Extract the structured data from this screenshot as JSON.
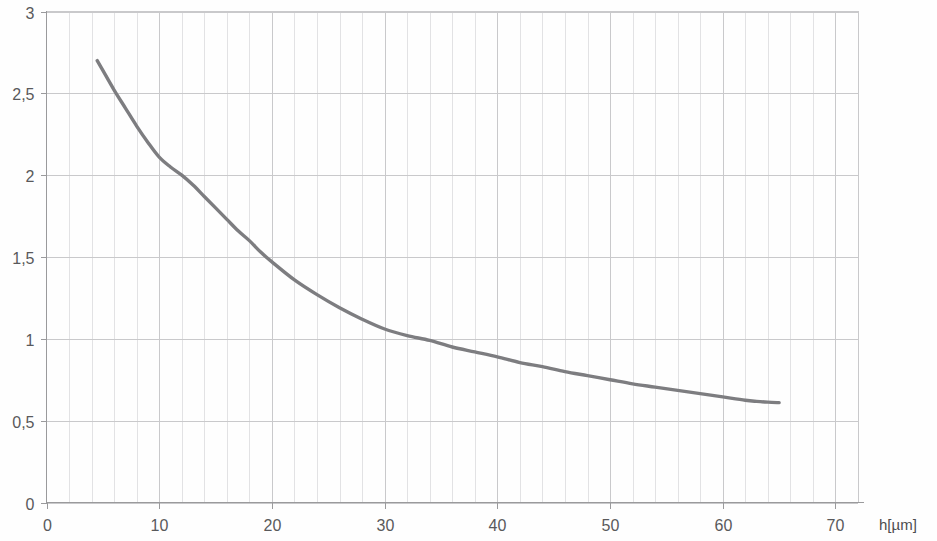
{
  "chart_data": {
    "type": "line",
    "title": "",
    "subtitle": "",
    "xlabel": "h[µm]",
    "ylabel": "",
    "xlim": [
      0,
      72
    ],
    "ylim": [
      0,
      3
    ],
    "grid": true,
    "legend": "none",
    "decimal_separator": ",",
    "x_ticks": [
      0,
      10,
      20,
      30,
      40,
      50,
      60,
      70
    ],
    "x_tick_labels": [
      "0",
      "10",
      "20",
      "30",
      "40",
      "50",
      "60",
      "70"
    ],
    "y_ticks": [
      0,
      0.5,
      1,
      1.5,
      2,
      2.5,
      3
    ],
    "y_tick_labels": [
      "0",
      "0,5",
      "1",
      "1,5",
      "2",
      "2,5",
      "3"
    ],
    "x_minor_step": 2,
    "series": [
      {
        "name": "curve",
        "color": "#7d7d80",
        "x": [
          4.5,
          5,
          6,
          7,
          8,
          9,
          10,
          11,
          12,
          13,
          14,
          15,
          16,
          17,
          18,
          19,
          20,
          22,
          24,
          26,
          28,
          30,
          32,
          34,
          36,
          38,
          40,
          42,
          44,
          46,
          48,
          50,
          52,
          54,
          56,
          58,
          60,
          62,
          63,
          64,
          65
        ],
        "y": [
          2.7,
          2.64,
          2.52,
          2.41,
          2.3,
          2.2,
          2.11,
          2.05,
          2.0,
          1.94,
          1.87,
          1.8,
          1.73,
          1.66,
          1.6,
          1.53,
          1.47,
          1.36,
          1.27,
          1.19,
          1.12,
          1.06,
          1.02,
          0.99,
          0.95,
          0.92,
          0.89,
          0.855,
          0.83,
          0.8,
          0.775,
          0.75,
          0.725,
          0.705,
          0.685,
          0.665,
          0.645,
          0.625,
          0.618,
          0.613,
          0.61
        ]
      }
    ]
  },
  "axis": {
    "x_title": "h[µm]",
    "x_labels": [
      "0",
      "10",
      "20",
      "30",
      "40",
      "50",
      "60",
      "70"
    ],
    "y_labels": [
      "3",
      "2,5",
      "2",
      "1,5",
      "1",
      "0,5",
      "0"
    ]
  },
  "colors": {
    "curve": "#7d7d80",
    "grid_major": "#c9c9cb",
    "grid_minor": "#e2e2e4",
    "axis": "#9a9a9c",
    "text": "#59595b",
    "background": "#fefefe"
  }
}
